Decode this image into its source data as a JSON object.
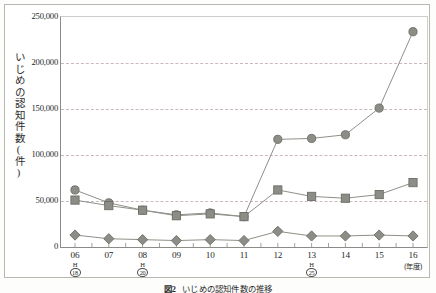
{
  "figure": {
    "caption_number": "図2",
    "caption_text": "いじめの認知件数の推移"
  },
  "axes": {
    "y_title": "いじめの認知件数(件)",
    "y_ticks": [
      "250,000",
      "200,000",
      "150,000",
      "100,000",
      "50,000",
      "0"
    ],
    "x_unit_note": "(年度)"
  },
  "x_labels": [
    {
      "year": "06",
      "era_top": "H",
      "era_bottom": "18"
    },
    {
      "year": "07",
      "era_top": "",
      "era_bottom": ""
    },
    {
      "year": "08",
      "era_top": "H",
      "era_bottom": "20"
    },
    {
      "year": "09",
      "era_top": "",
      "era_bottom": ""
    },
    {
      "year": "10",
      "era_top": "",
      "era_bottom": ""
    },
    {
      "year": "11",
      "era_top": "",
      "era_bottom": ""
    },
    {
      "year": "12",
      "era_top": "",
      "era_bottom": ""
    },
    {
      "year": "13",
      "era_top": "H",
      "era_bottom": "25"
    },
    {
      "year": "14",
      "era_top": "",
      "era_bottom": ""
    },
    {
      "year": "15",
      "era_top": "",
      "era_bottom": ""
    },
    {
      "year": "16",
      "era_top": "",
      "era_bottom": ""
    }
  ],
  "chart_data": {
    "type": "line",
    "title": "いじめの認知件数の推移",
    "xlabel": "(年度)",
    "ylabel": "いじめの認知件数(件)",
    "ylim": [
      0,
      250000
    ],
    "ytick_step": 50000,
    "grid": true,
    "legend_position": "none",
    "categories": [
      "06",
      "07",
      "08",
      "09",
      "10",
      "11",
      "12",
      "13",
      "14",
      "15",
      "16"
    ],
    "series": [
      {
        "name": "総数",
        "marker": "circle",
        "color": "#8c8c86",
        "values": [
          62000,
          48000,
          40000,
          35000,
          37000,
          33000,
          117000,
          118000,
          122000,
          151000,
          234000
        ]
      },
      {
        "name": "小学校",
        "marker": "square",
        "color": "#8c8c86",
        "values": [
          51000,
          45000,
          40000,
          34000,
          36000,
          33000,
          62000,
          55000,
          53000,
          57000,
          70000
        ]
      },
      {
        "name": "中学校",
        "marker": "diamond",
        "color": "#8c8c86",
        "values": [
          13000,
          9000,
          8000,
          7000,
          8000,
          7000,
          17000,
          12000,
          12000,
          13000,
          12000
        ]
      }
    ]
  },
  "style": {
    "line_color": "#8f8f89",
    "marker_fill": "#8d8d87",
    "marker_stroke": "#6d6d67",
    "grid_color": "#c8b8bf",
    "axis_color": "#8d8b87"
  }
}
